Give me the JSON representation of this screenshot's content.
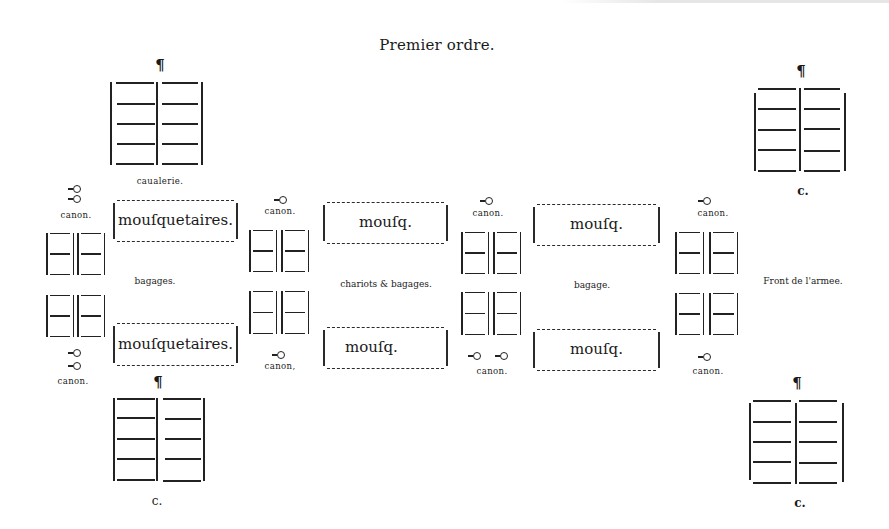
{
  "title": "Premier ordre.",
  "pilcrow": "¶",
  "cavalry": [
    {
      "id": "top-left",
      "label": "caualerie."
    },
    {
      "id": "top-right",
      "label": "c."
    },
    {
      "id": "bottom-left",
      "label": "c."
    },
    {
      "id": "bottom-right",
      "label": "c."
    }
  ],
  "musketeers": [
    {
      "id": "left-top",
      "label": "mouſquetaires."
    },
    {
      "id": "left-bottom",
      "label": "mouſquetaires."
    },
    {
      "id": "center-top",
      "label": "mouſq."
    },
    {
      "id": "center-bottom",
      "label": "mouſq."
    },
    {
      "id": "right-top",
      "label": "mouſq."
    },
    {
      "id": "right-bottom",
      "label": "mouſq."
    }
  ],
  "cannon_labels": [
    {
      "id": "col1-top",
      "label": "canon.",
      "count": 2
    },
    {
      "id": "col1-bottom",
      "label": "canon.",
      "count": 2
    },
    {
      "id": "col2-top",
      "label": "canon.",
      "count": 1
    },
    {
      "id": "col2-bottom",
      "label": "canon,",
      "count": 1
    },
    {
      "id": "col3-top",
      "label": "canon.",
      "count": 1
    },
    {
      "id": "col3-bottom",
      "label": "canon.",
      "count": 2
    },
    {
      "id": "col4-top",
      "label": "canon.",
      "count": 1
    },
    {
      "id": "col4-bottom",
      "label": "canon.",
      "count": 1
    }
  ],
  "middle_labels": {
    "left": "bagages.",
    "center": "chariots & bagages.",
    "right": "bagage.",
    "front": "Front de l'armee."
  }
}
